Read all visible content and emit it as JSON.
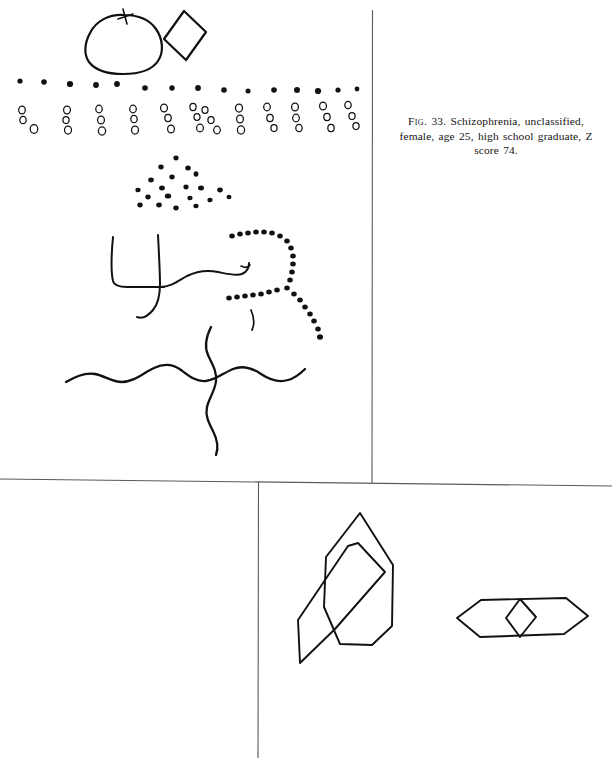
{
  "page": {
    "width": 612,
    "height": 758,
    "background_color": "#ffffff",
    "ink_color": "#111111",
    "rule_color": "#5a5a5a",
    "document_type": "bender-gestalt-test-reproduction-plate"
  },
  "caption": {
    "fig_label": "Fig.",
    "fig_number": "33.",
    "line1_rest": "Schizophrenia, unclassified,",
    "line2": "female, age 25, high school graduate, Z",
    "line3": "score 74.",
    "full_text": "Fig. 33. Schizophrenia, unclassified, female, age 25, high school graduate, Z score 74."
  },
  "rules": {
    "vertical_upper": {
      "x": 372,
      "y1": 10,
      "y2": 483
    },
    "horizontal_middle": {
      "x1": 0,
      "y1": 479,
      "x2": 612,
      "y2": 486
    },
    "vertical_lower": {
      "x": 258,
      "y1": 482,
      "y2": 758
    }
  },
  "figures": [
    {
      "id": "figure-a",
      "name": "circle-and-diamond",
      "label": "Figure A",
      "description": "Hand-drawn circle with small cross tick at top, adjoining tilted square (diamond)"
    },
    {
      "id": "figure-1",
      "name": "row-of-dots",
      "label": "Figure 1",
      "description": "Single horizontal row of filled dots",
      "dot_count": 15
    },
    {
      "id": "figure-2",
      "name": "rows-of-circle-columns",
      "label": "Figure 2",
      "description": "Slanted columns of three small open circles each",
      "column_count": 12,
      "circles_per_column": 3
    },
    {
      "id": "figure-3",
      "name": "dot-arrowhead-cluster",
      "label": "Figure 3",
      "description": "Cluster of filled dots, arrowhead organization lost",
      "dot_count": 20
    },
    {
      "id": "figure-4",
      "name": "open-square-and-curve",
      "label": "Figure 4",
      "description": "Open square (bell shape) with adjoining wavy curve"
    },
    {
      "id": "figure-5",
      "name": "dotted-arc-with-tail",
      "label": "Figure 5",
      "description": "Incomplete circle of dots with straight dotted extension"
    },
    {
      "id": "figure-6",
      "name": "crossing-sinusoidal-waves",
      "label": "Figure 6",
      "description": "Horizontal and vertical sinusoidal lines crossing"
    },
    {
      "id": "figure-7",
      "name": "overlapping-hexagons",
      "label": "Figure 7",
      "description": "Two elongated overlapping hexagons"
    },
    {
      "id": "figure-8",
      "name": "hexagon-with-inner-diamond",
      "label": "Figure 8",
      "description": "Elongated flat hexagon containing a small diamond"
    }
  ]
}
